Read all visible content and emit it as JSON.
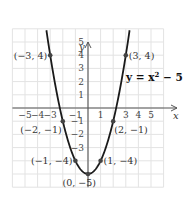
{
  "chart_data": {
    "type": "line",
    "title": "",
    "equation": "y = x² − 5",
    "equation_parts": {
      "lhs": "y = x",
      "exp": "2",
      "rhs": " − 5"
    },
    "xlabel": "x",
    "ylabel": "y",
    "xlim": [
      -6,
      6
    ],
    "ylim": [
      -6,
      6
    ],
    "grid": true,
    "x_ticks": [
      {
        "v": -5,
        "label": "−5"
      },
      {
        "v": -4,
        "label": "−4"
      },
      {
        "v": -3,
        "label": "−3"
      },
      {
        "v": -1,
        "label": "−1"
      },
      {
        "v": 1,
        "label": "1"
      },
      {
        "v": 3,
        "label": "3"
      },
      {
        "v": 4,
        "label": "4"
      },
      {
        "v": 5,
        "label": "5"
      }
    ],
    "y_ticks": [
      {
        "v": 5,
        "label": "5"
      },
      {
        "v": 4,
        "label": "4"
      },
      {
        "v": 3,
        "label": "3"
      },
      {
        "v": 2,
        "label": "2"
      },
      {
        "v": 1,
        "label": "1"
      },
      {
        "v": -1,
        "label": "−1"
      },
      {
        "v": -2,
        "label": "−2"
      },
      {
        "v": -3,
        "label": "−3"
      }
    ],
    "series": [
      {
        "name": "y = x² − 5",
        "function": "x^2 - 5",
        "domain": [
          -3.3,
          3.3
        ]
      }
    ],
    "points": [
      {
        "x": -3,
        "y": 4,
        "label": "(−3, 4)",
        "side": "left"
      },
      {
        "x": 3,
        "y": 4,
        "label": "(3, 4)",
        "side": "right"
      },
      {
        "x": -2,
        "y": -1,
        "label": "(−2, −1)",
        "side": "below-left"
      },
      {
        "x": 2,
        "y": -1,
        "label": "(2, −1)",
        "side": "below-right"
      },
      {
        "x": -1,
        "y": -4,
        "label": "(−1, −4)",
        "side": "left"
      },
      {
        "x": 1,
        "y": -4,
        "label": "(1, −4)",
        "side": "right"
      },
      {
        "x": 0,
        "y": -5,
        "label": "(0, −5)",
        "side": "below-left"
      }
    ]
  },
  "layout": {
    "origin_x": 88,
    "origin_y": 108,
    "sx": 12.6,
    "sy": 13.2
  }
}
